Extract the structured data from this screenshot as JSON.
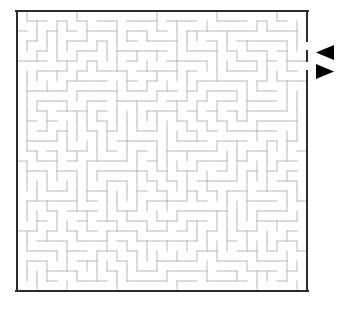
{
  "figure": {
    "kind": "maze-puzzle",
    "background_color": "#ffffff",
    "width": 348,
    "height": 313
  },
  "maze": {
    "columns": 29,
    "rows": 28,
    "cell_size": 10,
    "origin_x": 17,
    "origin_y": 11,
    "border_color": "#2b2b2b",
    "border_width": 2,
    "wall_color": "#b9b9b9",
    "wall_width": 1,
    "seed": 20240607,
    "entrance": {
      "side": "right",
      "row": 3,
      "label": "entrance"
    },
    "exit": {
      "side": "right",
      "row": 5,
      "label": "exit"
    }
  },
  "markers": [
    {
      "name": "entrance-arrow",
      "direction": "left",
      "color": "#000000",
      "x": 316,
      "y": 45,
      "width": 18,
      "height": 15
    },
    {
      "name": "exit-arrow",
      "direction": "right",
      "color": "#000000",
      "x": 316,
      "y": 64,
      "width": 18,
      "height": 15
    }
  ]
}
